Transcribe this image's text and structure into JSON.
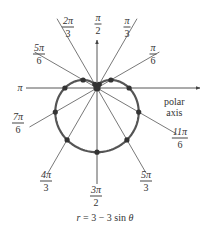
{
  "chart_data": {
    "type": "line",
    "subtype": "polar",
    "title": "",
    "equation": "r = 3 − 3 sin θ",
    "curve": "cardioid",
    "angle_labels": [
      {
        "angle": "π/6",
        "num": "π",
        "den": "6"
      },
      {
        "angle": "π/3",
        "num": "π",
        "den": "3"
      },
      {
        "angle": "π/2",
        "num": "π",
        "den": "2"
      },
      {
        "angle": "2π/3",
        "num": "2π",
        "den": "3"
      },
      {
        "angle": "5π/6",
        "num": "5π",
        "den": "6"
      },
      {
        "angle": "π",
        "num": "π",
        "den": ""
      },
      {
        "angle": "7π/6",
        "num": "7π",
        "den": "6"
      },
      {
        "angle": "4π/3",
        "num": "4π",
        "den": "3"
      },
      {
        "angle": "3π/2",
        "num": "3π",
        "den": "2"
      },
      {
        "angle": "5π/3",
        "num": "5π",
        "den": "3"
      },
      {
        "angle": "11π/6",
        "num": "11π",
        "den": "6"
      }
    ],
    "points": [
      {
        "theta": "0",
        "r": 3
      },
      {
        "theta": "π/6",
        "r": 1.5
      },
      {
        "theta": "π/3",
        "r": 0.4
      },
      {
        "theta": "π/2",
        "r": 0
      },
      {
        "theta": "2π/3",
        "r": 0.4
      },
      {
        "theta": "5π/6",
        "r": 1.5
      },
      {
        "theta": "π",
        "r": 3
      },
      {
        "theta": "7π/6",
        "r": 4.5
      },
      {
        "theta": "4π/3",
        "r": 5.6
      },
      {
        "theta": "3π/2",
        "r": 6
      },
      {
        "theta": "5π/3",
        "r": 5.6
      },
      {
        "theta": "11π/6",
        "r": 4.5
      }
    ],
    "axis_label": "polar axis",
    "grid": false
  },
  "labels": {
    "polar_axis_line1": "polar",
    "polar_axis_line2": "axis",
    "equation_prefix": "r",
    "equation_middle": " = 3 − 3 sin ",
    "equation_theta": "θ",
    "pi_left": "π",
    "l_pi6_num": "π",
    "l_pi6_den": "6",
    "l_pi3_num": "π",
    "l_pi3_den": "3",
    "l_pi2_num": "π",
    "l_pi2_den": "2",
    "l_2pi3_num": "2π",
    "l_2pi3_den": "3",
    "l_5pi6_num": "5π",
    "l_5pi6_den": "6",
    "l_7pi6_num": "7π",
    "l_7pi6_den": "6",
    "l_4pi3_num": "4π",
    "l_4pi3_den": "3",
    "l_3pi2_num": "3π",
    "l_3pi2_den": "2",
    "l_5pi3_num": "5π",
    "l_5pi3_den": "3",
    "l_11pi6_num": "11π",
    "l_11pi6_den": "6"
  },
  "colors": {
    "curve": "#555555",
    "rays": "#555555",
    "dots": "#333333"
  }
}
